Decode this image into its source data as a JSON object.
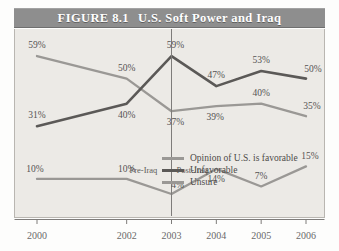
{
  "figure": {
    "number_label": "FIGURE 8.1",
    "title": "U.S. Soft Power and Iraq"
  },
  "annotations": {
    "pre_iraq": "Pre-Iraq",
    "post_iraq": "Post-Iraq"
  },
  "colors": {
    "title_bar": "#8e8e8e",
    "title_text": "#ffffff",
    "panel_background": "#eceae6",
    "panel_border": "#b9b6b1",
    "favorable_line": "#9a9895",
    "unfavorable_line": "#5b5957",
    "unsure_line": "#9a9895",
    "axis": "#7e7c7a",
    "label_text": "#555353"
  },
  "chart_data": {
    "type": "line",
    "title": "U.S. Soft Power and Iraq",
    "xlabel": "",
    "ylabel": "",
    "grid": false,
    "legend_position": "inside-center",
    "x": [
      2000,
      2002,
      2003,
      2004,
      2005,
      2006
    ],
    "categories": [
      "2000",
      "2002",
      "2003",
      "2004",
      "2005",
      "2006"
    ],
    "ylim": [
      0,
      65
    ],
    "xlim": [
      2000,
      2006
    ],
    "value_suffix": "%",
    "divider": {
      "x": 2003,
      "label_left": "Pre-Iraq",
      "label_right": "Post-Iraq"
    },
    "series": [
      {
        "name": "Opinion of U.S. is favorable",
        "color": "#9a9895",
        "values": [
          59,
          50,
          37,
          39,
          40,
          35
        ],
        "point_labels": [
          "59%",
          "50%",
          "37%",
          "39%",
          "40%",
          "35%"
        ]
      },
      {
        "name": "Unfavorable",
        "color": "#5b5957",
        "values": [
          31,
          40,
          59,
          47,
          53,
          50
        ],
        "point_labels": [
          "31%",
          "40%",
          "59%",
          "47%",
          "53%",
          "50%"
        ]
      },
      {
        "name": "Unsure",
        "color": "#9a9895",
        "values": [
          10,
          10,
          4,
          14,
          7,
          15
        ],
        "point_labels": [
          "10%",
          "10%",
          "4%",
          "14%",
          "7%",
          "15%"
        ]
      }
    ],
    "legend": [
      "Opinion of U.S. is favorable",
      "Unfavorable",
      "Unsure"
    ]
  }
}
